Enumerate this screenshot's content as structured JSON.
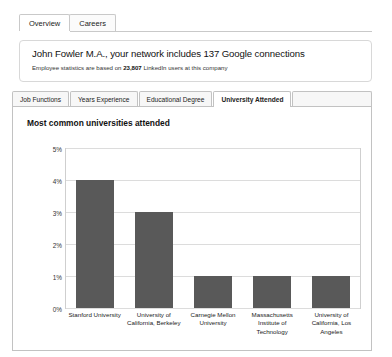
{
  "top_tabs": [
    {
      "label": "Overview",
      "active": true
    },
    {
      "label": "Careers",
      "active": false
    }
  ],
  "info": {
    "headline": "John Fowler M.A., your network includes 137 Google connections",
    "subtitle_prefix": "Employee statistics are based on ",
    "subtitle_count": "23,807",
    "subtitle_suffix": " LinkedIn users at this company"
  },
  "section_tabs": [
    {
      "label": "Job Functions",
      "active": false
    },
    {
      "label": "Years Experience",
      "active": false
    },
    {
      "label": "Educational Degree",
      "active": false
    },
    {
      "label": "University Attended",
      "active": true
    }
  ],
  "colors": {
    "bar": "#595959",
    "grid": "#dcdcdc",
    "panel_border": "#c2c2c2"
  },
  "chart_data": {
    "type": "bar",
    "title": "Most common universities attended",
    "xlabel": "",
    "ylabel": "",
    "ylim": [
      0,
      5
    ],
    "ytick_labels": [
      "5%",
      "4%",
      "3%",
      "2%",
      "1%",
      "0%"
    ],
    "ytick_values": [
      5,
      4,
      3,
      2,
      1,
      0
    ],
    "grid": true,
    "legend": "none",
    "categories": [
      "Stanford University",
      "University of California, Berkeley",
      "Carnegie Mellon University",
      "Massachusetts Institute of Technology",
      "University of California, Los Angeles"
    ],
    "values": [
      4,
      3,
      1,
      1,
      1
    ]
  }
}
